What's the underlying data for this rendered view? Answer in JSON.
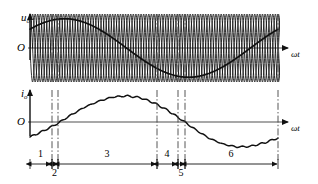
{
  "figure": {
    "title": "",
    "top_axis": {
      "y_label": "u",
      "y_sub": "o",
      "x_label": "ωt",
      "origin": "O"
    },
    "bottom_axis": {
      "y_label": "i",
      "y_sub": "o",
      "x_label": "ωt",
      "origin": "O"
    },
    "segments": [
      {
        "id": "1",
        "label": "1",
        "x_start": 30,
        "x_end": 52
      },
      {
        "id": "2",
        "label": "2",
        "x_start": 52,
        "x_end": 58
      },
      {
        "id": "3",
        "label": "3",
        "x_start": 58,
        "x_end": 157
      },
      {
        "id": "4",
        "label": "4",
        "x_start": 157,
        "x_end": 178
      },
      {
        "id": "5",
        "label": "5",
        "x_start": 178,
        "x_end": 185
      },
      {
        "id": "6",
        "label": "6",
        "x_start": 185,
        "x_end": 278
      }
    ],
    "boundaries": [
      52,
      58,
      157,
      178,
      185,
      278
    ],
    "colors": {
      "curve": "#111111",
      "axis": "#808080",
      "dashdot": "#555555",
      "carrier": "#1a1a1a"
    }
  },
  "chart_data": [
    {
      "type": "line",
      "title": "",
      "name": "output-voltage-uo",
      "xlabel": "ωt",
      "ylabel": "uo",
      "xlim": [
        0,
        360
      ],
      "ylim": [
        -1.15,
        1.15
      ],
      "grid": false,
      "legend": "none",
      "series": [
        {
          "name": "carrier-band",
          "description": "dense overlapping commutation sinusoids forming a band",
          "kind": "carrier",
          "cycles": 24,
          "amplitude": 1.0
        },
        {
          "name": "fundamental-envelope",
          "description": "slow output fundamental sine, one cycle, phase shifted",
          "kind": "fundamental",
          "amplitude": 0.86,
          "phase_deg": 40,
          "x": [
            0,
            20,
            40,
            60,
            80,
            100,
            120,
            140,
            160,
            180,
            200,
            220,
            240,
            260,
            280,
            300,
            320,
            340,
            360
          ],
          "y": [
            0.05,
            0.42,
            0.7,
            0.85,
            0.86,
            0.72,
            0.48,
            0.18,
            -0.15,
            -0.45,
            -0.68,
            -0.83,
            -0.86,
            -0.78,
            -0.58,
            -0.3,
            0.02,
            0.34,
            0.62
          ]
        }
      ]
    },
    {
      "type": "line",
      "title": "",
      "name": "output-current-io",
      "xlabel": "ωt",
      "ylabel": "io",
      "xlim": [
        0,
        360
      ],
      "ylim": [
        -1.1,
        1.1
      ],
      "grid": false,
      "legend": "none",
      "series": [
        {
          "name": "output-current",
          "description": "rippled sinusoidal load current, zero crossings at segment 2 and 5",
          "amplitude": 0.9,
          "x": [
            0,
            20,
            40,
            60,
            80,
            100,
            120,
            140,
            160,
            180,
            200,
            220,
            240,
            260,
            280,
            300,
            320,
            340,
            360
          ],
          "y": [
            -0.52,
            -0.3,
            -0.05,
            0.25,
            0.52,
            0.72,
            0.86,
            0.9,
            0.84,
            0.66,
            0.4,
            0.08,
            -0.26,
            -0.56,
            -0.76,
            -0.86,
            -0.84,
            -0.72,
            -0.55
          ]
        }
      ]
    }
  ]
}
